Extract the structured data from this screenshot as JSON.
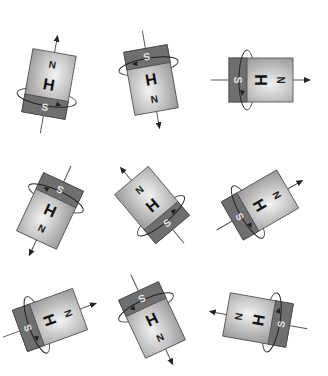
{
  "figure": {
    "colors": {
      "north_light": "#e6e6e6",
      "north_dark": "#8a8a8a",
      "south": "#6f6f6f",
      "outline": "#4a4a4a",
      "line": "#555555"
    },
    "labels": {
      "north": "N",
      "south": "S",
      "center": "H"
    },
    "magnets": [
      {
        "id": 1,
        "cx": 49,
        "cy": 84,
        "angle": 10,
        "north": "N",
        "south": "S",
        "center": "H"
      },
      {
        "id": 2,
        "cx": 151,
        "cy": 80,
        "angle": 170,
        "north": "N",
        "south": "S",
        "center": "H"
      },
      {
        "id": 3,
        "cx": 261,
        "cy": 80,
        "angle": 90,
        "north": "N",
        "south": "S",
        "center": "H"
      },
      {
        "id": 4,
        "cx": 50,
        "cy": 211,
        "angle": 205,
        "north": "N",
        "south": "S",
        "center": "H"
      },
      {
        "id": 5,
        "cx": 152,
        "cy": 205,
        "angle": -40,
        "north": "N",
        "south": "S",
        "center": "H"
      },
      {
        "id": 6,
        "cx": 260,
        "cy": 205,
        "angle": 60,
        "north": "N",
        "south": "S",
        "center": "H"
      },
      {
        "id": 7,
        "cx": 50,
        "cy": 320,
        "angle": 70,
        "north": "N",
        "south": "S",
        "center": "H"
      },
      {
        "id": 8,
        "cx": 152,
        "cy": 320,
        "angle": 155,
        "north": "N",
        "south": "S",
        "center": "H"
      },
      {
        "id": 9,
        "cx": 258,
        "cy": 320,
        "angle": -80,
        "north": "N",
        "south": "S",
        "center": "H"
      }
    ]
  }
}
